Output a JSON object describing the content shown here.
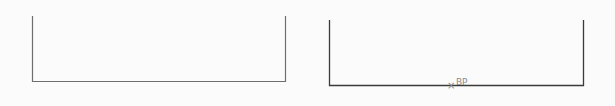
{
  "diagram": {
    "shapes": [
      {
        "id": "left-open-rectangle",
        "type": "open-top-rectangle",
        "left_x": 32,
        "right_x": 285,
        "top_y": 16,
        "bottom_y": 81,
        "stroke": "#6e6e6e"
      },
      {
        "id": "right-open-rectangle",
        "type": "open-top-rectangle",
        "left_x": 329,
        "right_x": 583,
        "top_y": 20,
        "bottom_y": 85,
        "stroke": "#3a3a3a"
      }
    ],
    "marker": {
      "symbol": "×",
      "label": "BP",
      "x": 452,
      "y": 86,
      "color": "#8a8a8a"
    }
  }
}
